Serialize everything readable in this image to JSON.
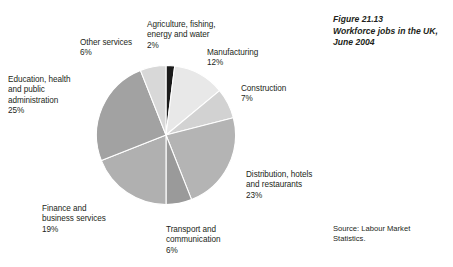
{
  "caption": {
    "figure_number": "Figure 21.13",
    "figure_title": "Workforce jobs in the UK, June 2004"
  },
  "source": {
    "line1": "Source: Labour Market",
    "line2": "Statistics."
  },
  "chart_data": {
    "type": "pie",
    "title": "Workforce jobs in the UK, June 2004",
    "xlabel": "",
    "ylabel": "",
    "legend_position": "none",
    "grid": false,
    "units": "percent",
    "total": 100,
    "start_angle_deg": 0,
    "direction": "clockwise",
    "categories": [
      "Agriculture, fishing, energy and water",
      "Manufacturing",
      "Construction",
      "Distribution, hotels and restaurants",
      "Transport and communication",
      "Finance and business services",
      "Education, health and public administration",
      "Other services"
    ],
    "values": [
      2,
      12,
      7,
      23,
      6,
      19,
      25,
      6
    ],
    "colors": [
      "#1b1b1b",
      "#e8e8e8",
      "#d2d2d2",
      "#b4b4b4",
      "#9a9a9a",
      "#b0b0b0",
      "#a2a2a2",
      "#d8d8d8"
    ],
    "slices": [
      {
        "name": "Agriculture, fishing, energy and water",
        "label_line1": "Agriculture, fishing,",
        "label_line2": "energy and water",
        "value": 2,
        "percent_label": "2%",
        "color": "#1b1b1b"
      },
      {
        "name": "Manufacturing",
        "label_line1": "Manufacturing",
        "label_line2": "",
        "value": 12,
        "percent_label": "12%",
        "color": "#e8e8e8"
      },
      {
        "name": "Construction",
        "label_line1": "Construction",
        "label_line2": "",
        "value": 7,
        "percent_label": "7%",
        "color": "#d2d2d2"
      },
      {
        "name": "Distribution, hotels and restaurants",
        "label_line1": "Distribution, hotels",
        "label_line2": "and restaurants",
        "value": 23,
        "percent_label": "23%",
        "color": "#b4b4b4"
      },
      {
        "name": "Transport and communication",
        "label_line1": "Transport and",
        "label_line2": "communication",
        "value": 6,
        "percent_label": "6%",
        "color": "#9a9a9a"
      },
      {
        "name": "Finance and business services",
        "label_line1": "Finance and",
        "label_line2": "business services",
        "value": 19,
        "percent_label": "19%",
        "color": "#b0b0b0"
      },
      {
        "name": "Education, health and public administration",
        "label_line1": "Education, health",
        "label_line2": "and public",
        "label_line3": "administration",
        "value": 25,
        "percent_label": "25%",
        "color": "#a2a2a2"
      },
      {
        "name": "Other services",
        "label_line1": "Other services",
        "label_line2": "",
        "value": 6,
        "percent_label": "6%",
        "color": "#d8d8d8"
      }
    ]
  }
}
